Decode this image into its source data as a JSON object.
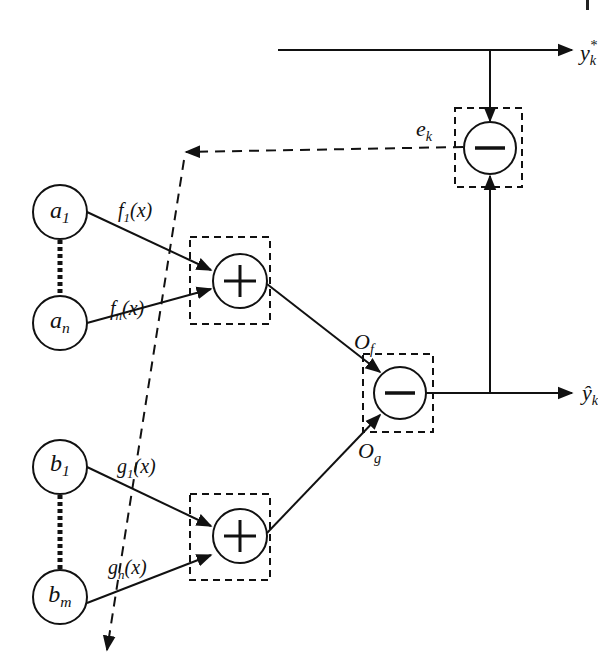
{
  "diagram": {
    "type": "block-diagram",
    "colors": {
      "stroke": "#111111",
      "background": "#ffffff"
    },
    "input_nodes_a": [
      {
        "id": "a1",
        "base": "a",
        "sub": "1"
      },
      {
        "id": "an",
        "base": "a",
        "sub": "n"
      }
    ],
    "input_nodes_b": [
      {
        "id": "b1",
        "base": "b",
        "sub": "1"
      },
      {
        "id": "bm",
        "base": "b",
        "sub": "m"
      }
    ],
    "edge_labels": {
      "f1": {
        "base": "f",
        "sub": "1",
        "arg": "(x)"
      },
      "fn": {
        "base": "f",
        "sub": "n",
        "arg": "(x)"
      },
      "g1": {
        "base": "g",
        "sub": "1",
        "arg": "(x)"
      },
      "gn": {
        "base": "g",
        "sub": "n",
        "arg": "(x)"
      }
    },
    "operators": {
      "sum_top": {
        "symbol": "plus-icon"
      },
      "sum_bottom": {
        "symbol": "plus-icon"
      },
      "output_diff": {
        "symbol": "minus-icon"
      },
      "error_diff": {
        "symbol": "minus-icon"
      }
    },
    "signals": {
      "Of": {
        "base": "O",
        "sub": "f"
      },
      "Og": {
        "base": "O",
        "sub": "g"
      },
      "ek": {
        "base": "e",
        "sub": "k"
      },
      "y_hat": {
        "base": "ŷ",
        "sub": "k"
      },
      "y_star": {
        "base": "y",
        "sub": "k",
        "sup": "*"
      }
    }
  }
}
